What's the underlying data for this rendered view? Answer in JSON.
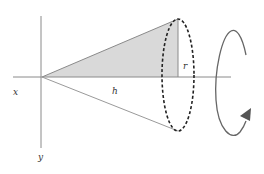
{
  "diagram": {
    "labels": {
      "x_axis": "x",
      "y_axis": "y",
      "height": "h",
      "radius": "r"
    },
    "colors": {
      "axis": "#8a8a8a",
      "cone_edge": "#8a8a8a",
      "fill": "#d9d9d9",
      "ellipse": "#222222",
      "arrow": "#555555",
      "label": "#333333"
    }
  }
}
